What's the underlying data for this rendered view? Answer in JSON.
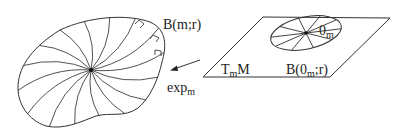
{
  "diagram": {
    "type": "exponential-map-illustration",
    "manifold_ball_label": {
      "main": "B(m;r)"
    },
    "map_label": {
      "main": "exp",
      "subscript": "m"
    },
    "tangent_space_label": {
      "main": "T",
      "subscript": "m",
      "suffix": "M"
    },
    "tangent_ball_label": {
      "prefix": "B(0",
      "subscript": "m",
      "suffix": ";r)"
    },
    "origin_label": {
      "main": "0",
      "subscript": "m"
    },
    "geodesic_count": 16,
    "tangent_ray_count": 10,
    "arrow_direction": "from tangent plane toward manifold ball",
    "colors": {
      "ink": "#333333",
      "background": "#ffffff"
    }
  }
}
